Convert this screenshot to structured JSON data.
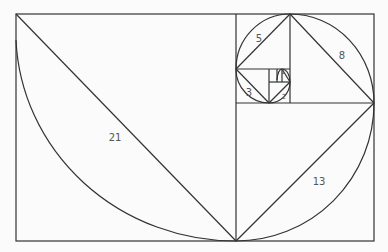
{
  "diagram": {
    "stroke_color": "#333333",
    "background": "#fbfbfb",
    "labels": [
      {
        "text": "21",
        "x": 115,
        "y": 137
      },
      {
        "text": "13",
        "x": 319,
        "y": 181
      },
      {
        "text": "8",
        "x": 342,
        "y": 55
      },
      {
        "text": "5",
        "x": 259,
        "y": 38
      },
      {
        "text": "3",
        "x": 249,
        "y": 92
      },
      {
        "text": "2",
        "x": 284,
        "y": 97
      },
      {
        "text": "1",
        "x": 283,
        "y": 72
      }
    ]
  }
}
